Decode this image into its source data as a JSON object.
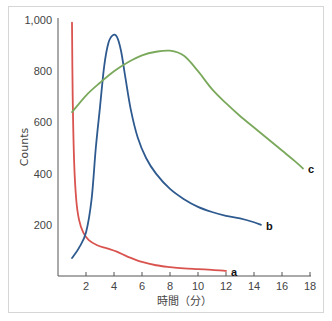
{
  "chart_data": {
    "type": "line",
    "title": "",
    "xlabel": "時間（分）",
    "ylabel": "Counts",
    "xlim": [
      0,
      18
    ],
    "ylim": [
      0,
      1000
    ],
    "x_ticks": [
      2,
      4,
      6,
      8,
      10,
      12,
      14,
      16,
      18
    ],
    "x_tick_labels": [
      "2",
      "4",
      "6",
      "8",
      "10",
      "12",
      "14",
      "16",
      "18"
    ],
    "y_ticks": [
      200,
      400,
      600,
      800,
      1000
    ],
    "y_tick_labels": [
      "200",
      "400",
      "600",
      "800",
      "1,000"
    ],
    "grid": false,
    "legend": "inline end-of-line labels",
    "series": [
      {
        "name": "a",
        "color": "#d9534f",
        "x": [
          1.0,
          1.05,
          1.15,
          1.3,
          1.5,
          1.8,
          2.2,
          2.8,
          3.5,
          4.2,
          5.0,
          6.0,
          7.0,
          8.0,
          9.0,
          10.0,
          11.0,
          12.0
        ],
        "y": [
          990,
          700,
          450,
          300,
          220,
          170,
          140,
          120,
          108,
          95,
          75,
          55,
          42,
          35,
          30,
          27,
          24,
          20
        ]
      },
      {
        "name": "b",
        "color": "#2e5a8f",
        "x": [
          1.0,
          1.5,
          2.0,
          2.4,
          2.7,
          3.0,
          3.3,
          3.6,
          3.9,
          4.2,
          4.5,
          4.8,
          5.2,
          5.7,
          6.3,
          7.0,
          8.0,
          9.0,
          10.0,
          11.0,
          12.0,
          13.0,
          14.0,
          14.5
        ],
        "y": [
          70,
          110,
          170,
          300,
          500,
          660,
          820,
          910,
          940,
          935,
          880,
          780,
          650,
          540,
          460,
          400,
          340,
          300,
          270,
          250,
          235,
          225,
          210,
          200
        ]
      },
      {
        "name": "c",
        "color": "#7aa95c",
        "x": [
          1.0,
          2.0,
          3.0,
          4.0,
          5.0,
          6.0,
          7.0,
          8.0,
          9.0,
          10.0,
          11.0,
          12.0,
          13.0,
          14.0,
          15.0,
          16.0,
          17.0,
          17.5
        ],
        "y": [
          640,
          705,
          755,
          800,
          835,
          862,
          876,
          880,
          860,
          800,
          730,
          675,
          625,
          580,
          535,
          490,
          445,
          420
        ]
      }
    ]
  }
}
